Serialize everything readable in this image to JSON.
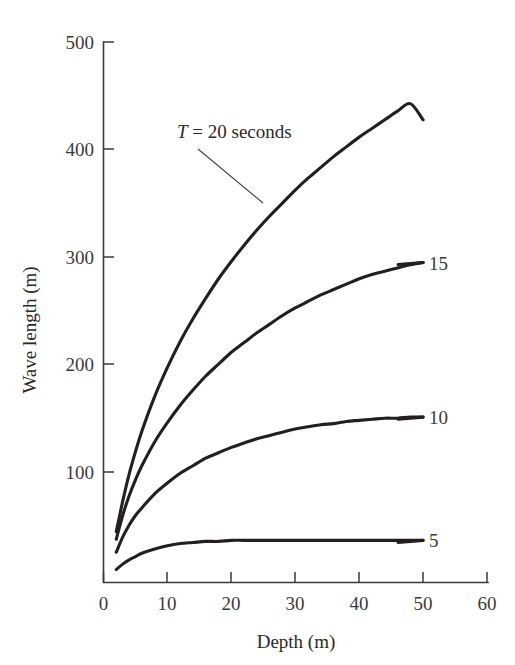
{
  "chart_data": {
    "type": "line",
    "title": "",
    "xlabel": "Depth (m)",
    "ylabel": "Wave length (m)",
    "xlim": [
      0,
      60
    ],
    "ylim": [
      0,
      500
    ],
    "xticks": [
      0,
      10,
      20,
      30,
      40,
      50,
      60
    ],
    "xtick_labels": [
      "0",
      "10",
      "20",
      "30",
      "40",
      "50",
      "60"
    ],
    "yticks": [
      100,
      200,
      300,
      400,
      500
    ],
    "ytick_labels": [
      "100",
      "200",
      "300",
      "400",
      "500"
    ],
    "grid": false,
    "legend_position": "inline-right-of-curve-ends",
    "annotations": [
      {
        "name": "period-callout",
        "text_prefix": "T",
        "text_rest": " = 20 seconds",
        "points_to_series": "T = 20 seconds"
      }
    ],
    "x": [
      2,
      3,
      4,
      5,
      6,
      8,
      10,
      12,
      14,
      16,
      18,
      20,
      22,
      24,
      26,
      28,
      30,
      32,
      34,
      36,
      38,
      40,
      42,
      44,
      46,
      48,
      50
    ],
    "series": [
      {
        "name": "T = 20 seconds",
        "label": "20",
        "period_seconds": 20,
        "values": [
          44,
          54,
          62,
          69,
          76,
          88,
          98,
          107,
          116,
          124,
          131,
          139,
          146,
          152,
          159,
          165,
          171,
          177,
          183,
          188,
          194,
          199,
          204,
          209,
          214,
          219,
          224
        ]
      },
      {
        "name": "15",
        "label": "15",
        "period_seconds": 15,
        "values": [
          44,
          53,
          61,
          68,
          75,
          86,
          96,
          105,
          113,
          120,
          127,
          134,
          140,
          146,
          151,
          157,
          162,
          167,
          171,
          176,
          180,
          185,
          189,
          193,
          196,
          200,
          204
        ]
      },
      {
        "name": "10",
        "label": "10",
        "period_seconds": 10,
        "values": [
          43,
          52,
          60,
          66,
          72,
          82,
          91,
          98,
          105,
          111,
          116,
          121,
          125,
          129,
          132,
          135,
          138,
          140,
          142,
          144,
          146,
          147,
          148,
          149,
          150,
          151,
          152
        ]
      },
      {
        "name": "5",
        "label": "5",
        "period_seconds": 5,
        "values": [
          20,
          24,
          27,
          29,
          31,
          34,
          36,
          37,
          38,
          38,
          39,
          39,
          39,
          39,
          39,
          39,
          39,
          39,
          39,
          39,
          39,
          39,
          39,
          39,
          39,
          39,
          39
        ]
      }
    ],
    "plotted_curves": [
      {
        "name": "T = 20 seconds",
        "label": "20",
        "endpoint": {
          "x": 50,
          "y": 428
        },
        "sample_points": [
          [
            2,
            47
          ],
          [
            3,
            75
          ],
          [
            4,
            100
          ],
          [
            5,
            121
          ],
          [
            6,
            140
          ],
          [
            8,
            172
          ],
          [
            10,
            199
          ],
          [
            12,
            223
          ],
          [
            14,
            244
          ],
          [
            16,
            263
          ],
          [
            18,
            281
          ],
          [
            20,
            297
          ],
          [
            22,
            312
          ],
          [
            24,
            326
          ],
          [
            26,
            339
          ],
          [
            28,
            351
          ],
          [
            30,
            363
          ],
          [
            32,
            374
          ],
          [
            34,
            384
          ],
          [
            36,
            394
          ],
          [
            38,
            403
          ],
          [
            40,
            412
          ],
          [
            42,
            420
          ],
          [
            44,
            428
          ],
          [
            46,
            436
          ],
          [
            48,
            443
          ],
          [
            50,
            428
          ]
        ]
      },
      {
        "name": "15",
        "label": "15",
        "endpoint": {
          "x": 50,
          "y": 296
        },
        "sample_points": [
          [
            2,
            40
          ],
          [
            3,
            62
          ],
          [
            4,
            80
          ],
          [
            5,
            95
          ],
          [
            6,
            108
          ],
          [
            8,
            130
          ],
          [
            10,
            148
          ],
          [
            12,
            164
          ],
          [
            14,
            178
          ],
          [
            16,
            191
          ],
          [
            18,
            202
          ],
          [
            20,
            213
          ],
          [
            22,
            222
          ],
          [
            24,
            231
          ],
          [
            26,
            239
          ],
          [
            28,
            247
          ],
          [
            30,
            254
          ],
          [
            32,
            260
          ],
          [
            34,
            266
          ],
          [
            36,
            271
          ],
          [
            38,
            276
          ],
          [
            40,
            281
          ],
          [
            42,
            285
          ],
          [
            44,
            288
          ],
          [
            46,
            291
          ],
          [
            48,
            294
          ],
          [
            50,
            296
          ]
        ]
      },
      {
        "name": "10",
        "label": "10",
        "endpoint": {
          "x": 50,
          "y": 153
        },
        "sample_points": [
          [
            2,
            28
          ],
          [
            3,
            42
          ],
          [
            4,
            53
          ],
          [
            5,
            62
          ],
          [
            6,
            69
          ],
          [
            8,
            82
          ],
          [
            10,
            92
          ],
          [
            12,
            101
          ],
          [
            14,
            108
          ],
          [
            16,
            115
          ],
          [
            18,
            120
          ],
          [
            20,
            125
          ],
          [
            22,
            129
          ],
          [
            24,
            133
          ],
          [
            26,
            136
          ],
          [
            28,
            139
          ],
          [
            30,
            142
          ],
          [
            32,
            144
          ],
          [
            34,
            146
          ],
          [
            36,
            147
          ],
          [
            38,
            149
          ],
          [
            40,
            150
          ],
          [
            42,
            151
          ],
          [
            44,
            152
          ],
          [
            46,
            152
          ],
          [
            48,
            153
          ],
          [
            50,
            153
          ]
        ]
      },
      {
        "name": "5",
        "label": "5",
        "endpoint": {
          "x": 50,
          "y": 39
        },
        "sample_points": [
          [
            2,
            12
          ],
          [
            3,
            17
          ],
          [
            4,
            21
          ],
          [
            5,
            24
          ],
          [
            6,
            27
          ],
          [
            8,
            31
          ],
          [
            10,
            34
          ],
          [
            12,
            36
          ],
          [
            14,
            37
          ],
          [
            16,
            38
          ],
          [
            18,
            38
          ],
          [
            20,
            39
          ],
          [
            22,
            39
          ],
          [
            24,
            39
          ],
          [
            26,
            39
          ],
          [
            28,
            39
          ],
          [
            30,
            39
          ],
          [
            32,
            39
          ],
          [
            34,
            39
          ],
          [
            36,
            39
          ],
          [
            38,
            39
          ],
          [
            40,
            39
          ],
          [
            42,
            39
          ],
          [
            44,
            39
          ],
          [
            46,
            39
          ],
          [
            48,
            39
          ],
          [
            50,
            39
          ]
        ]
      }
    ]
  },
  "figure": {
    "background_color": "#ffffff",
    "curve_color": "#231f20",
    "axis_color": "#3a3a3c",
    "text_color": "#2b2829"
  }
}
